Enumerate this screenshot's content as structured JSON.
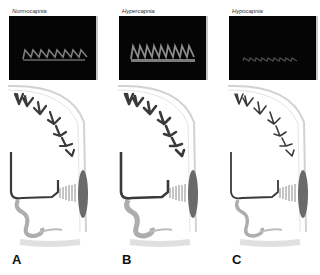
{
  "figure": {
    "panels": [
      {
        "id": "A",
        "letter": "A",
        "condition": "Normocapnia",
        "waveform": {
          "beats": 8,
          "peak_height": 10,
          "baseline_y": 43,
          "brightness": "#8a8a8a",
          "vessel_diameter": "normal"
        }
      },
      {
        "id": "B",
        "letter": "B",
        "condition": "Hypercapnia",
        "waveform": {
          "beats": 9,
          "peak_height": 14,
          "baseline_y": 43,
          "brightness": "#9a9a9a",
          "vessel_diameter": "dilated"
        }
      },
      {
        "id": "C",
        "letter": "C",
        "condition": "Hypocapnia",
        "waveform": {
          "beats": 10,
          "peak_height": 4,
          "baseline_y": 45,
          "brightness": "#555555",
          "vessel_diameter": "constricted"
        }
      }
    ],
    "colors": {
      "doppler_background": "#050505",
      "vessel": "#3a3a3a",
      "head_outline": "#cfcfcf",
      "probe": "#6a6a6a"
    }
  }
}
